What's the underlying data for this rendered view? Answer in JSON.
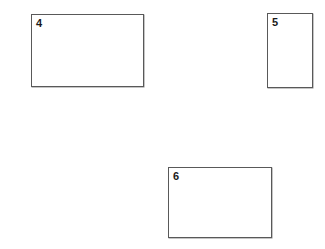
{
  "figure": {
    "background_color": "#ffffff",
    "width": 325,
    "height": 249,
    "border_color": "#595959",
    "label_color": "#1a1a1a",
    "shapes": [
      {
        "label": "4",
        "kind": "rectangle",
        "orientation": "landscape",
        "x": 31,
        "y": 14,
        "width": 113,
        "height": 73
      },
      {
        "label": "5",
        "kind": "rectangle",
        "orientation": "portrait",
        "x": 267,
        "y": 13,
        "width": 46,
        "height": 75
      },
      {
        "label": "6",
        "kind": "rectangle",
        "orientation": "landscape",
        "x": 168,
        "y": 167,
        "width": 104,
        "height": 71
      }
    ]
  }
}
